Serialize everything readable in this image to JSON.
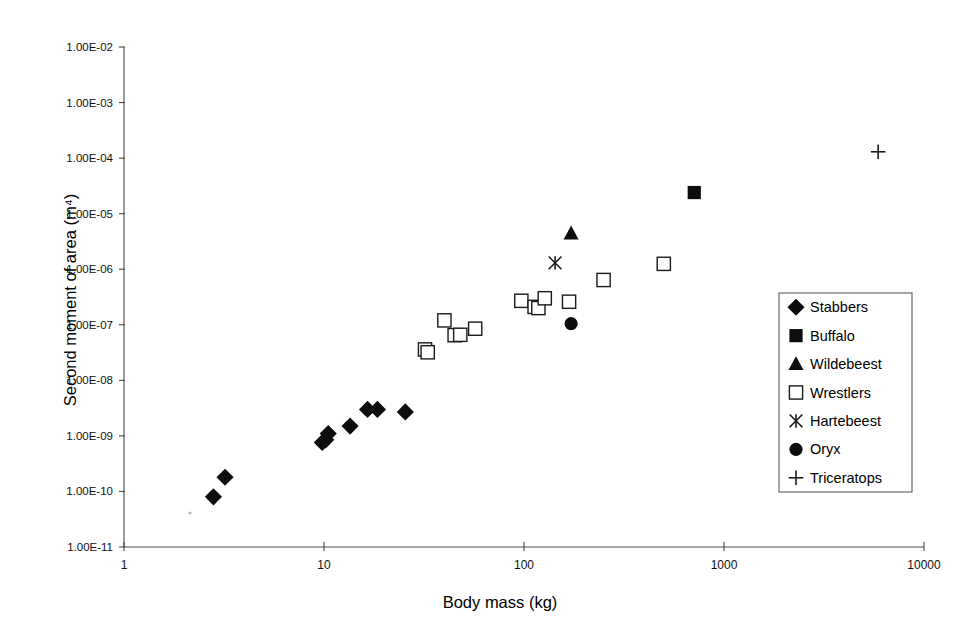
{
  "chart_data": {
    "type": "scatter",
    "title": "",
    "xlabel": "Body mass (kg)",
    "ylabel": "Second moment of area (m⁴)",
    "xscale": "log",
    "yscale": "log",
    "xlim": [
      1,
      10000
    ],
    "ylim": [
      1e-11,
      0.01
    ],
    "grid": false,
    "legend_position": "right-inside",
    "xticks": [
      "1",
      "10",
      "100",
      "1000",
      "10000"
    ],
    "xtick_values": [
      1,
      10,
      100,
      1000,
      10000
    ],
    "yticks": [
      "1.00E-11",
      "1.00E-10",
      "1.00E-09",
      "1.00E-08",
      "1.00E-07",
      "1.00E-06",
      "1.00E-05",
      "1.00E-04",
      "1.00E-03",
      "1.00E-02"
    ],
    "ytick_values": [
      1e-11,
      1e-10,
      1e-09,
      1e-08,
      1e-07,
      1e-06,
      1e-05,
      0.0001,
      0.001,
      0.01
    ],
    "series": [
      {
        "name": "Stabbers",
        "marker": "diamond-filled",
        "points": [
          [
            2.8,
            8e-11
          ],
          [
            3.2,
            1.8e-10
          ],
          [
            9.8,
            7.6e-10
          ],
          [
            10.2,
            8.5e-10
          ],
          [
            10.5,
            1.1e-09
          ],
          [
            13.5,
            1.5e-09
          ],
          [
            16.5,
            3e-09
          ],
          [
            18.5,
            3e-09
          ],
          [
            25.5,
            2.7e-09
          ]
        ]
      },
      {
        "name": "Buffalo",
        "marker": "square-filled",
        "points": [
          [
            710,
            2.4e-05
          ]
        ]
      },
      {
        "name": "Wildebeest",
        "marker": "triangle-filled",
        "points": [
          [
            172,
            4.4e-06
          ]
        ]
      },
      {
        "name": "Wrestlers",
        "marker": "square-open",
        "points": [
          [
            32,
            3.6e-08
          ],
          [
            33,
            3.2e-08
          ],
          [
            40,
            1.2e-07
          ],
          [
            45,
            6.5e-08
          ],
          [
            48,
            6.6e-08
          ],
          [
            57,
            8.5e-08
          ],
          [
            97,
            2.7e-07
          ],
          [
            113,
            2.1e-07
          ],
          [
            118,
            2e-07
          ],
          [
            127,
            3e-07
          ],
          [
            168,
            2.6e-07
          ],
          [
            250,
            6.4e-07
          ],
          [
            500,
            1.25e-06
          ]
        ]
      },
      {
        "name": "Hartebeest",
        "marker": "x-cross",
        "points": [
          [
            143,
            1.3e-06
          ]
        ]
      },
      {
        "name": "Oryx",
        "marker": "circle-filled",
        "points": [
          [
            172,
            1.05e-07
          ]
        ]
      },
      {
        "name": "Triceratops",
        "marker": "plus",
        "points": [
          [
            5900,
            0.00013
          ]
        ]
      }
    ]
  },
  "legend": {
    "entries": [
      {
        "label": "Stabbers",
        "marker": "diamond-filled"
      },
      {
        "label": "Buffalo",
        "marker": "square-filled"
      },
      {
        "label": "Wildebeest",
        "marker": "triangle-filled"
      },
      {
        "label": "Wrestlers",
        "marker": "square-open"
      },
      {
        "label": "Hartebeest",
        "marker": "x-cross"
      },
      {
        "label": "Oryx",
        "marker": "circle-filled"
      },
      {
        "label": "Triceratops",
        "marker": "plus"
      }
    ]
  }
}
